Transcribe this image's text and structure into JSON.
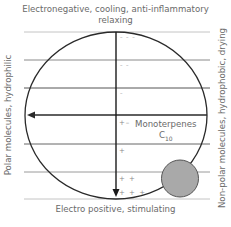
{
  "diagram": {
    "title_top_line1": "Electronegative, cooling, anti-inflammatory",
    "title_top_line2": "relaxing",
    "label_bottom": "Electro positive, stimulating",
    "label_left": "Polar molecules, hydrophilic",
    "label_right": "Non-polar molecules, hydrophobic, drying",
    "compound_name": "Monoterpenes",
    "compound_formula_base": "C",
    "compound_formula_sub": "10",
    "charge_marks": [
      {
        "level": 1,
        "text": "– – –"
      },
      {
        "level": 2,
        "text": "– –"
      },
      {
        "level": 3,
        "text": "–"
      },
      {
        "level": 4,
        "text": "+–"
      },
      {
        "level": 5,
        "text": "+"
      },
      {
        "level": 6,
        "text": "+ +"
      },
      {
        "level": 7,
        "text": "+ + +"
      }
    ],
    "colors": {
      "circle_stroke": "#2a2a2a",
      "axis": "#1a1a1a",
      "light_line": "#bfbfbf",
      "mid_line": "#8a8a8a",
      "ball_fill": "#a9a9a9",
      "ball_stroke": "#555555",
      "text": "#6a6a6a"
    }
  }
}
